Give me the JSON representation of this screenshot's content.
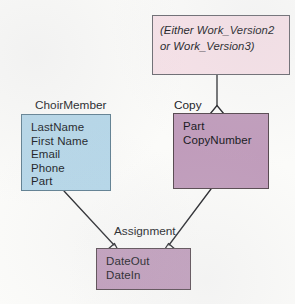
{
  "diagram": {
    "type": "entity-relationship-diagram",
    "background_color": "#fbfbf9",
    "line_color": "#26272b",
    "notation": "crow-foot-triangle",
    "entities": [
      {
        "id": "choirmember",
        "title": "ChoirMember",
        "fill_color": "#b5d7e9",
        "border_color": "#5e7e90",
        "attributes": [
          "LastName",
          "First Name",
          "Email",
          "Phone",
          "Part"
        ]
      },
      {
        "id": "copy",
        "title": "Copy",
        "fill_color": "#c09cbb",
        "border_color": "#56484f",
        "attributes": [
          "Part",
          "CopyNumber"
        ]
      },
      {
        "id": "assignment",
        "title": "Assignment",
        "fill_color": "#c09cbb",
        "border_color": "#56484f",
        "attributes": [
          "DateOut",
          "DateIn"
        ]
      }
    ],
    "notes": [
      {
        "id": "work-version-note",
        "text": "(Either Work_Version2 or Work_Version3)",
        "fill_color": "#f7e2e8",
        "border_color": "#6a6a70",
        "italic": true,
        "attaches_to": "copy"
      }
    ],
    "relationships": [
      {
        "id": "note-to-copy",
        "from": "work-version-note",
        "to": "copy",
        "end_marker": "triangle"
      },
      {
        "id": "choirmember-to-assignment",
        "from": "choirmember",
        "to": "assignment",
        "end_marker": "triangle"
      },
      {
        "id": "copy-to-assignment",
        "from": "copy",
        "to": "assignment",
        "end_marker": "triangle"
      }
    ]
  }
}
